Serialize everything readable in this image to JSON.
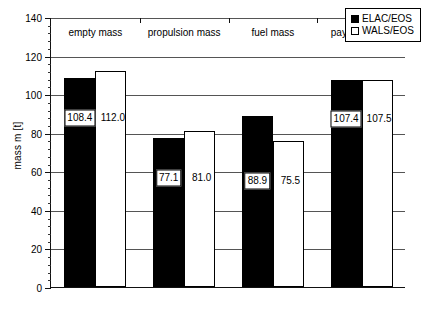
{
  "chart_data": {
    "type": "bar",
    "title": "",
    "xlabel": "",
    "ylabel": "mass m [t]",
    "ylim": [
      0,
      140
    ],
    "ytick_step": 20,
    "yminor_step": 4,
    "grid": true,
    "legend_position": "top-right",
    "categories": [
      "empty mass",
      "propulsion mass",
      "fuel mass",
      "payload mass"
    ],
    "ytick_labels": [
      "0",
      "20",
      "40",
      "60",
      "80",
      "100",
      "120",
      "140"
    ],
    "series": [
      {
        "name": "ELAC/EOS",
        "style": "filled-black",
        "color": "#000000",
        "label_style": "boxed",
        "values": [
          108.4,
          77.1,
          88.9,
          107.4
        ],
        "value_labels": [
          "108.4",
          "77.1",
          "88.9",
          "107.4"
        ]
      },
      {
        "name": "WALS/EOS",
        "style": "outlined-white",
        "color": "#ffffff",
        "label_style": "plain",
        "values": [
          112.0,
          81.0,
          75.5,
          107.5
        ],
        "value_labels": [
          "112.0",
          "81.0",
          "75.5",
          "107.5"
        ]
      }
    ]
  },
  "legend": {
    "items": [
      {
        "label": "ELAC/EOS",
        "swatch": "filled-square-black"
      },
      {
        "label": "WALS/EOS",
        "swatch": "outlined-square-white"
      }
    ]
  }
}
